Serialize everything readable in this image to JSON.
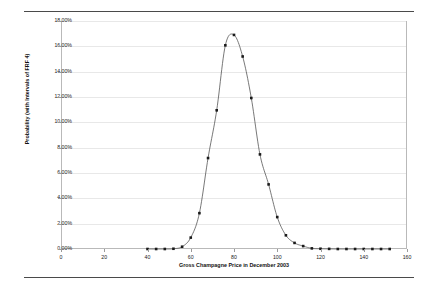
{
  "document": {
    "faint_header": "",
    "top_rule": "horizontal-rule",
    "bottom_rule": "horizontal-rule"
  },
  "chart_data": {
    "type": "line",
    "title": "",
    "xlabel": "Gross Champagne Price in December 2003",
    "ylabel": "Probability (with Intervals of FRF 4)",
    "xlim": [
      0,
      160
    ],
    "ylim": [
      0,
      0.18
    ],
    "grid": true,
    "legend": null,
    "marker": "square",
    "marker_color": "#1a1a1a",
    "line_color": "#555555",
    "xticks": [
      0,
      20,
      40,
      60,
      80,
      100,
      120,
      140,
      160
    ],
    "xticklabels": [
      "0",
      "20",
      "40",
      "60",
      "80",
      "100",
      "120",
      "140",
      "160"
    ],
    "yticks": [
      0,
      0.02,
      0.04,
      0.06,
      0.08,
      0.1,
      0.12,
      0.14,
      0.16,
      0.18
    ],
    "yticklabels": [
      "0.00%",
      "2.00%",
      "4.00%",
      "6.00%",
      "8.00%",
      "10.00%",
      "12.00%",
      "14.00%",
      "16.00%",
      "18.00%"
    ],
    "x": [
      40,
      44,
      48,
      52,
      56,
      60,
      64,
      68,
      72,
      76,
      80,
      84,
      88,
      92,
      96,
      100,
      104,
      108,
      112,
      116,
      120,
      124,
      128,
      132,
      136,
      140,
      144,
      148,
      152
    ],
    "values": [
      0.0,
      0.0,
      0.0,
      0.0002,
      0.0018,
      0.009,
      0.0283,
      0.0718,
      0.1095,
      0.1608,
      0.169,
      0.152,
      0.1192,
      0.0747,
      0.051,
      0.0252,
      0.0108,
      0.0048,
      0.0023,
      0.0005,
      0.0002,
      0.0001,
      0.0,
      0.0,
      0.0,
      0.0,
      0.0,
      0.0,
      0.0
    ],
    "value_labels": [
      "0.00%",
      "0.00%",
      "0.00%",
      "0.02%",
      "0.18%",
      "0.90%",
      "2.83%",
      "7.18%",
      "10.95%",
      "16.08%",
      "16.90%",
      "15.20%",
      "11.92%",
      "7.47%",
      "5.10%",
      "2.52%",
      "1.08%",
      "0.48%",
      "0.23%",
      "0.05%",
      "0.02%",
      "0.01%",
      "0.00%",
      "0.00%",
      "0.00%",
      "0.00%",
      "0.00%",
      "0.00%",
      "0.00%"
    ]
  }
}
